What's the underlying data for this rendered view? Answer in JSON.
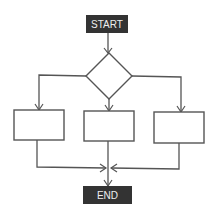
{
  "diagram": {
    "type": "flowchart",
    "colors": {
      "terminal_fill": "#333333",
      "terminal_text": "#eeeeee",
      "stroke": "#555555",
      "background": "#ffffff"
    },
    "nodes": {
      "start": {
        "label": "START",
        "shape": "terminal"
      },
      "decision": {
        "label": "",
        "shape": "diamond"
      },
      "process_left": {
        "label": "",
        "shape": "rectangle"
      },
      "process_middle": {
        "label": "",
        "shape": "rectangle"
      },
      "process_right": {
        "label": "",
        "shape": "rectangle"
      },
      "end": {
        "label": "END",
        "shape": "terminal"
      }
    },
    "edges": [
      {
        "from": "start",
        "to": "decision"
      },
      {
        "from": "decision",
        "to": "process_left"
      },
      {
        "from": "decision",
        "to": "process_middle"
      },
      {
        "from": "decision",
        "to": "process_right"
      },
      {
        "from": "process_left",
        "to": "end"
      },
      {
        "from": "process_middle",
        "to": "end"
      },
      {
        "from": "process_right",
        "to": "end"
      }
    ]
  }
}
